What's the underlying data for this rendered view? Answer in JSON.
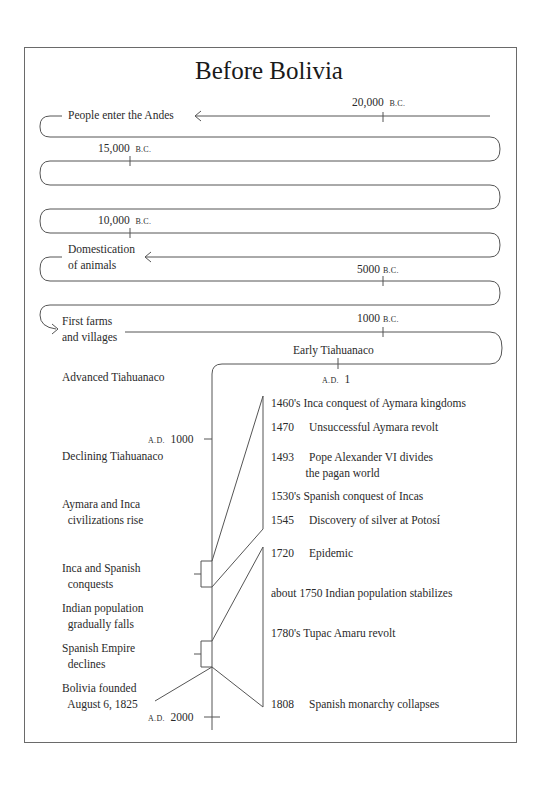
{
  "title": "Before Bolivia",
  "colors": {
    "line": "#555555",
    "text": "#2a2a2a",
    "frame": "#6a6a6a",
    "background": "#ffffff"
  },
  "serpentine": {
    "markers": [
      {
        "num": "20,000",
        "era": "B.C."
      },
      {
        "num": "15,000",
        "era": "B.C."
      },
      {
        "num": "10,000",
        "era": "B.C."
      },
      {
        "num": "5000",
        "era": "B.C."
      },
      {
        "num": "1000",
        "era": "B.C."
      },
      {
        "era": "A.D.",
        "num": "1"
      }
    ],
    "events": [
      {
        "label": "People enter the Andes"
      },
      {
        "label_line1": "Domestication",
        "label_line2": "of animals"
      },
      {
        "label_line1": "First farms",
        "label_line2": "and villages"
      },
      {
        "label": "Early Tiahuanaco"
      }
    ]
  },
  "vertical_axis": {
    "markers": [
      {
        "era": "A.D.",
        "num": "1000"
      },
      {
        "era": "A.D.",
        "num": "2000"
      }
    ],
    "periods": [
      {
        "line1": "Advanced Tiahuanaco"
      },
      {
        "line1": "Declining Tiahuanaco"
      },
      {
        "line1": "Aymara and Inca",
        "line2": "civilizations rise"
      },
      {
        "line1": "Inca and Spanish",
        "line2": "conquests"
      },
      {
        "line1": "Indian population",
        "line2": "gradually falls"
      },
      {
        "line1": "Spanish Empire",
        "line2": "declines"
      },
      {
        "line1": "Bolivia founded",
        "line2": "August 6, 1825"
      }
    ]
  },
  "detail_events": [
    {
      "year": "1460's",
      "text": "Inca conquest of Aymara kingdoms"
    },
    {
      "year": "1470",
      "text": "Unsuccessful Aymara revolt"
    },
    {
      "year": "1493",
      "text": "Pope Alexander VI divides",
      "text2": "the pagan world"
    },
    {
      "year": "1530's",
      "text": "Spanish conquest of Incas"
    },
    {
      "year": "1545",
      "text": "Discovery of silver at Potosí"
    },
    {
      "year": "1720",
      "text": "Epidemic"
    },
    {
      "year": "about 1750",
      "text": "Indian population stabilizes"
    },
    {
      "year": "1780's",
      "text": "Tupac Amaru revolt"
    },
    {
      "year": "1808",
      "text": "Spanish monarchy collapses"
    }
  ]
}
